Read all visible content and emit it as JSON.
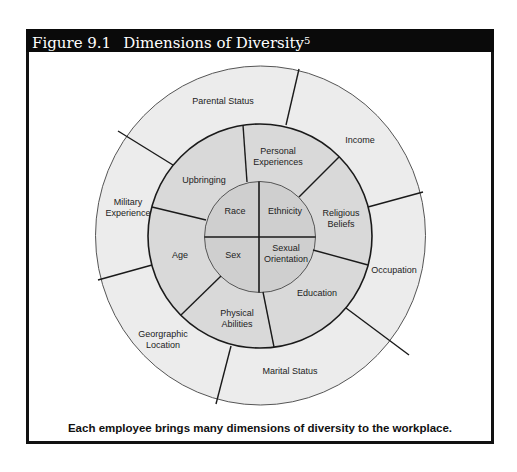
{
  "figure": {
    "number": "Figure 9.1",
    "title": "Dimensions of Diversity",
    "footnote": "5",
    "caption": "Each employee brings many dimensions of diversity to the workplace."
  },
  "colors": {
    "header_bg": "#0a0a0a",
    "outer_ring": "#ececec",
    "middle_ring": "#d9d9d9",
    "inner_circle": "#cfcfcf",
    "lines": "#1a1a1a"
  },
  "wheel": {
    "inner": {
      "race": "Race",
      "ethnicity": "Ethnicity",
      "sex": "Sex",
      "sexual_orientation_1": "Sexual",
      "sexual_orientation_2": "Orientation"
    },
    "middle": {
      "upbringing": "Upbringing",
      "personal_experiences_1": "Personal",
      "personal_experiences_2": "Experiences",
      "religious_beliefs_1": "Religious",
      "religious_beliefs_2": "Beliefs",
      "education": "Education",
      "physical_abilities_1": "Physical",
      "physical_abilities_2": "Abilities",
      "age": "Age"
    },
    "outer": {
      "parental_status": "Parental Status",
      "income": "Income",
      "occupation": "Occupation",
      "marital_status": "Marital Status",
      "geographic_location_1": "Georgraphic",
      "geographic_location_2": "Location",
      "military_experience_1": "Military",
      "military_experience_2": "Experience"
    }
  }
}
